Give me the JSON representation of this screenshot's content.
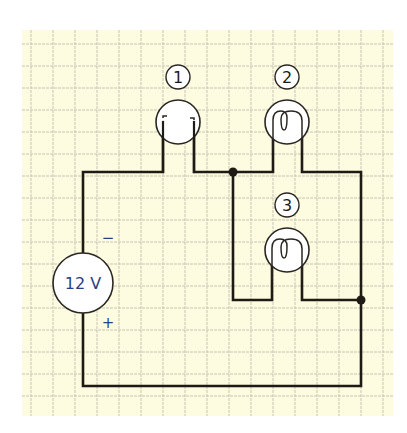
{
  "diagram": {
    "type": "circuit",
    "background_color": "#fdfbe0",
    "grid_color": "#c8c5b4",
    "wire_color": "#1e1a14",
    "source": {
      "label": "12 V",
      "negative_sign": "−",
      "positive_sign": "+",
      "text_color": "#2a3f80"
    },
    "bulbs": [
      {
        "id": "1",
        "label": "1",
        "state": "broken filament",
        "position": "top-left, series"
      },
      {
        "id": "2",
        "label": "2",
        "state": "intact filament",
        "position": "top-right, parallel branch"
      },
      {
        "id": "3",
        "label": "3",
        "state": "intact filament",
        "position": "middle, parallel branch"
      }
    ],
    "junctions": [
      {
        "name": "junction-top",
        "description": "after bulb 1, splits to bulb 2 and bulb 3 branches"
      },
      {
        "name": "junction-right",
        "description": "rejoins bulb 2 and bulb 3 branches"
      }
    ]
  }
}
